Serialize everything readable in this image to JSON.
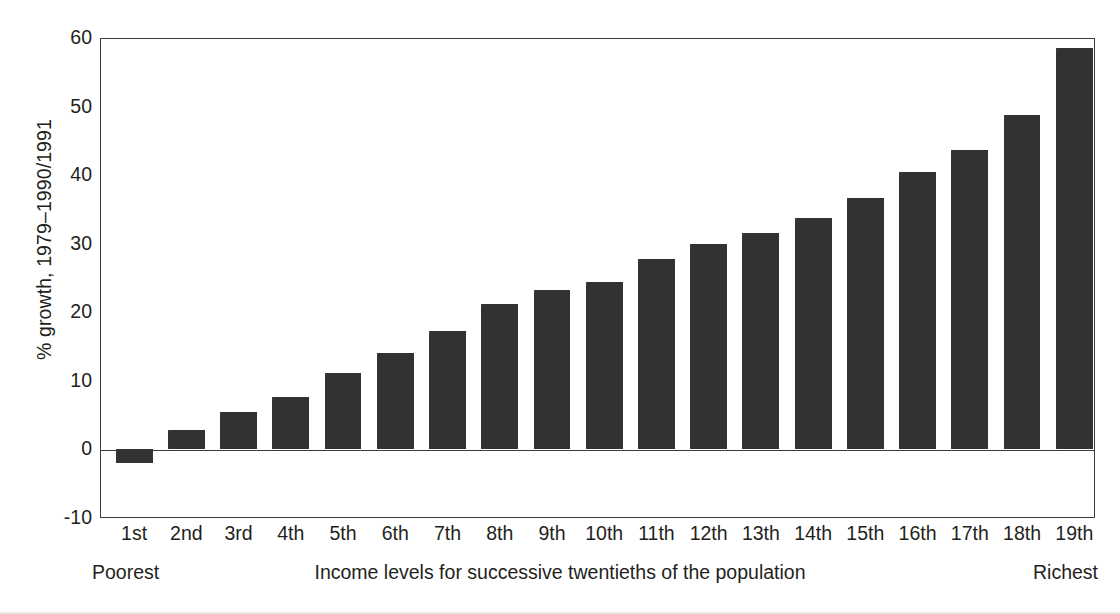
{
  "chart_data": {
    "type": "bar",
    "title": "",
    "xlabel": "Income levels for successive twentieths of the population",
    "ylabel": "% growth, 1979–1990/1991",
    "categories": [
      "1st",
      "2nd",
      "3rd",
      "4th",
      "5th",
      "6th",
      "7th",
      "8th",
      "9th",
      "10th",
      "11th",
      "12th",
      "13th",
      "14th",
      "15th",
      "16th",
      "17th",
      "18th",
      "19th"
    ],
    "values": [
      -2.0,
      2.8,
      5.5,
      7.7,
      11.2,
      14.0,
      17.2,
      21.2,
      23.3,
      24.4,
      27.7,
      30.0,
      31.6,
      33.8,
      36.6,
      40.5,
      43.7,
      48.8,
      58.5
    ],
    "ylim": [
      -10,
      60
    ],
    "yticks": [
      -10,
      0,
      10,
      20,
      30,
      40,
      50,
      60
    ],
    "ytick_labels": [
      "-10",
      "0",
      "10",
      "20",
      "30",
      "40",
      "50",
      "60"
    ],
    "grid": false,
    "legend": null,
    "bar_color": "#333132",
    "axis_color": "#3b3b3b",
    "text_color": "#231f20",
    "zero_line": 0
  },
  "caption": {
    "left": "Poorest",
    "center": "Income levels for successive twentieths of the population",
    "right": "Richest"
  }
}
